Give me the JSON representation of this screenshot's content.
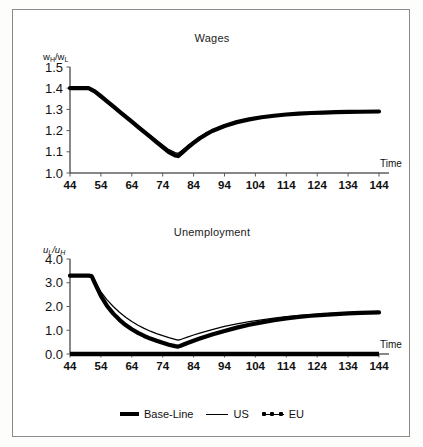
{
  "figure": {
    "background": "#ffffff",
    "border_color": "#8a8a8a"
  },
  "legend": {
    "items": [
      {
        "label": "Base-Line",
        "style": "thick-line",
        "color": "#000000"
      },
      {
        "label": "US",
        "style": "thin-line",
        "color": "#000000"
      },
      {
        "label": "EU",
        "style": "line-with-markers",
        "color": "#000000"
      }
    ]
  },
  "chart_data": [
    {
      "id": "wages",
      "type": "line",
      "title": "Wages",
      "xlabel": "Time",
      "ylabel": "wH/wL",
      "ylabel_parts": {
        "num": "w",
        "num_sub": "H",
        "den": "w",
        "den_sub": "L"
      },
      "xlim": [
        44,
        144
      ],
      "ylim": [
        1.0,
        1.5
      ],
      "xticks": [
        44,
        54,
        64,
        74,
        84,
        94,
        104,
        114,
        124,
        134,
        144
      ],
      "yticks": [
        1.0,
        1.1,
        1.2,
        1.3,
        1.4,
        1.5
      ],
      "grid": false,
      "legend_position": "below-figure",
      "x": [
        44,
        46,
        48,
        50,
        52,
        54,
        56,
        58,
        60,
        62,
        64,
        66,
        68,
        70,
        72,
        74,
        76,
        78,
        79,
        80,
        82,
        84,
        86,
        88,
        90,
        94,
        98,
        102,
        106,
        110,
        114,
        118,
        122,
        126,
        130,
        134,
        138,
        144
      ],
      "series": [
        {
          "name": "EU",
          "values": [
            1.4,
            1.4,
            1.4,
            1.4,
            1.385,
            1.362,
            1.338,
            1.314,
            1.29,
            1.266,
            1.242,
            1.218,
            1.194,
            1.17,
            1.146,
            1.122,
            1.098,
            1.083,
            1.08,
            1.092,
            1.118,
            1.142,
            1.164,
            1.182,
            1.198,
            1.222,
            1.24,
            1.253,
            1.263,
            1.27,
            1.276,
            1.28,
            1.283,
            1.285,
            1.287,
            1.288,
            1.289,
            1.29
          ]
        },
        {
          "name": "US",
          "values": [
            1.4,
            1.4,
            1.4,
            1.4,
            1.387,
            1.365,
            1.342,
            1.318,
            1.294,
            1.27,
            1.247,
            1.224,
            1.2,
            1.177,
            1.154,
            1.132,
            1.11,
            1.096,
            1.093,
            1.104,
            1.128,
            1.15,
            1.17,
            1.187,
            1.202,
            1.225,
            1.242,
            1.255,
            1.264,
            1.271,
            1.277,
            1.281,
            1.284,
            1.286,
            1.288,
            1.289,
            1.29,
            1.291
          ]
        }
      ]
    },
    {
      "id": "unemployment",
      "type": "line",
      "title": "Unemployment",
      "xlabel": "Time",
      "ylabel": "uL/uH",
      "ylabel_parts": {
        "num": "u",
        "num_sub": "L",
        "den": "u",
        "den_sub": "H"
      },
      "xlim": [
        44,
        144
      ],
      "ylim": [
        0.0,
        4.0
      ],
      "xticks": [
        44,
        54,
        64,
        74,
        84,
        94,
        104,
        114,
        124,
        134,
        144
      ],
      "yticks": [
        0.0,
        1.0,
        2.0,
        3.0,
        4.0
      ],
      "grid": false,
      "legend_position": "below-figure",
      "x": [
        44,
        46,
        48,
        50,
        51,
        52,
        54,
        56,
        58,
        60,
        62,
        64,
        66,
        68,
        70,
        72,
        74,
        76,
        78,
        79,
        80,
        82,
        84,
        86,
        90,
        94,
        98,
        102,
        106,
        110,
        114,
        118,
        122,
        126,
        130,
        134,
        138,
        144
      ],
      "series": [
        {
          "name": "EU",
          "values": [
            3.3,
            3.3,
            3.3,
            3.3,
            3.28,
            3.0,
            2.45,
            2.02,
            1.7,
            1.44,
            1.22,
            1.04,
            0.89,
            0.76,
            0.65,
            0.56,
            0.47,
            0.39,
            0.33,
            0.31,
            0.36,
            0.46,
            0.56,
            0.65,
            0.82,
            0.97,
            1.11,
            1.23,
            1.33,
            1.42,
            1.5,
            1.56,
            1.61,
            1.65,
            1.68,
            1.71,
            1.73,
            1.75
          ]
        },
        {
          "name": "US",
          "values": [
            3.3,
            3.3,
            3.3,
            3.3,
            3.28,
            3.05,
            2.62,
            2.28,
            2.0,
            1.76,
            1.55,
            1.37,
            1.21,
            1.08,
            0.96,
            0.86,
            0.77,
            0.69,
            0.62,
            0.58,
            0.62,
            0.71,
            0.8,
            0.88,
            1.03,
            1.16,
            1.27,
            1.36,
            1.44,
            1.51,
            1.57,
            1.62,
            1.66,
            1.69,
            1.72,
            1.74,
            1.75,
            1.76
          ]
        },
        {
          "name": "Base-Line",
          "values": [
            0.0,
            0.0,
            0.0,
            0.0,
            0.0,
            0.0,
            0.0,
            0.0,
            0.0,
            0.0,
            0.0,
            0.0,
            0.0,
            0.0,
            0.0,
            0.0,
            0.0,
            0.0,
            0.0,
            0.0,
            0.0,
            0.0,
            0.0,
            0.0,
            0.0,
            0.0,
            0.0,
            0.0,
            0.0,
            0.0,
            0.0,
            0.0,
            0.0,
            0.0,
            0.0,
            0.0,
            0.0,
            0.0
          ]
        }
      ]
    }
  ]
}
